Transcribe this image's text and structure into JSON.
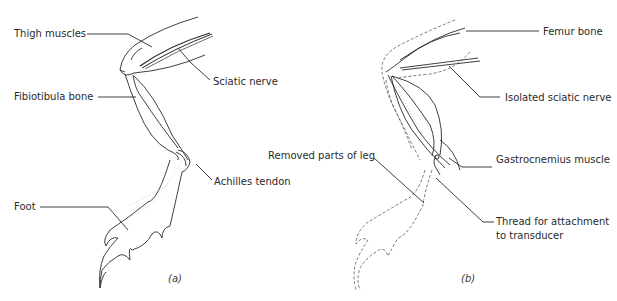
{
  "figure_a": {
    "caption": "(a)",
    "labels": {
      "thigh_muscles": "Thigh muscles",
      "sciatic_nerve": "Sciatic nerve",
      "fibiotibula_bone": "Fibiotibula bone",
      "achilles_tendon": "Achilles tendon",
      "foot": "Foot"
    }
  },
  "figure_b": {
    "caption": "(b)",
    "labels": {
      "femur_bone": "Femur bone",
      "isolated_sciatic_nerve": "Isolated sciatic nerve",
      "removed_parts": "Removed parts of leg",
      "gastrocnemius": "Gastrocnemius muscle",
      "thread_line1": "Thread for attachment",
      "thread_line2": "to transducer"
    }
  },
  "colors": {
    "line": "#2a2a2a",
    "dashed": "#555555",
    "stipple": "#aaaaaa"
  }
}
